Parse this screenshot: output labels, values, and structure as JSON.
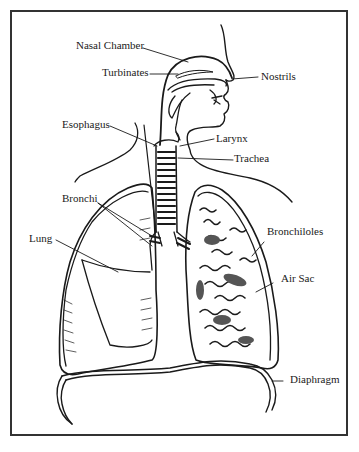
{
  "diagram": {
    "labels": {
      "nasal_chamber": "Nasal Chamber",
      "turbinates": "Turbinates",
      "nostrils": "Nostrils",
      "esophagus": "Esophagus",
      "larynx": "Larynx",
      "trachea": "Trachea",
      "bronchi": "Bronchi",
      "lung": "Lung",
      "bronchioles": "Bronchiloles",
      "air_sac": "Air Sac",
      "diaphragm": "Diaphragm"
    },
    "colors": {
      "ink": "#1a1a1a",
      "frame": "#333333",
      "background": "#ffffff"
    }
  }
}
